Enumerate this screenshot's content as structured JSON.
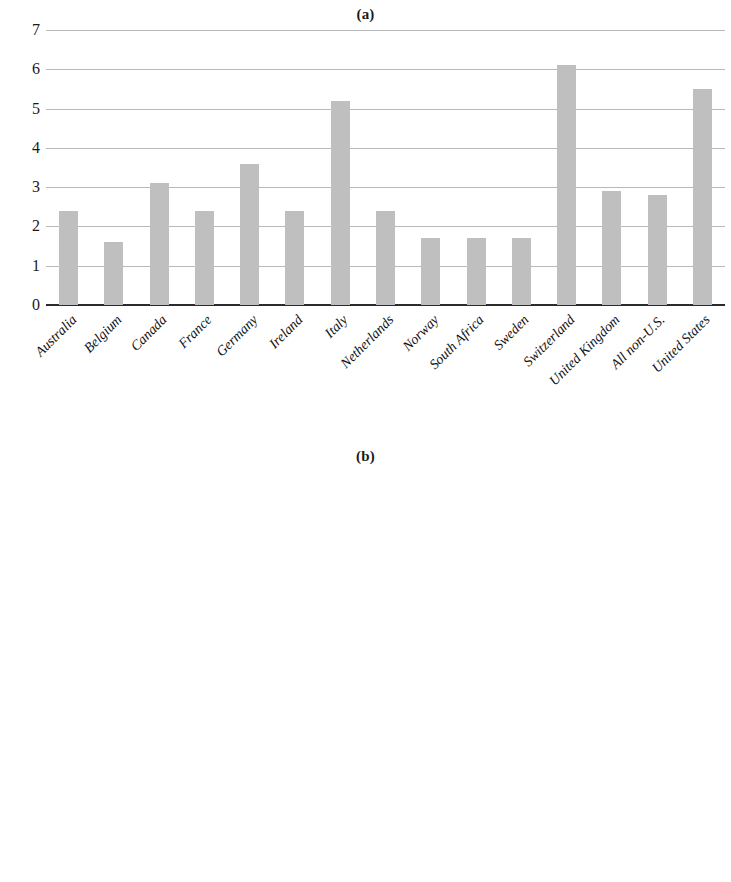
{
  "figure": {
    "panel_a_title": "(a)",
    "panel_b_title": "(b)"
  },
  "legend": {
    "items": [
      {
        "label": "Salary",
        "color": "#c9c9c9"
      },
      {
        "label": "Other",
        "color": "#a0a0a0"
      },
      {
        "label": "Bonuses",
        "color": "#595959"
      },
      {
        "label": "Stocks & Options",
        "color": "#e4e4e4"
      }
    ]
  },
  "chart_data": [
    {
      "type": "bar",
      "title": "(a)",
      "xlabel": "",
      "ylabel": "",
      "ylim": [
        0,
        7
      ],
      "yticks": [
        0,
        1,
        2,
        3,
        4,
        5,
        6,
        7
      ],
      "ytick_labels": [
        "0",
        "1",
        "2",
        "3",
        "4",
        "5",
        "6",
        "7"
      ],
      "grid": true,
      "legend": "none",
      "bar_color": "#bfbfbf",
      "categories": [
        "Australia",
        "Belgium",
        "Canada",
        "France",
        "Germany",
        "Ireland",
        "Italy",
        "Netherlands",
        "Norway",
        "South Africa",
        "Sweden",
        "Switzerland",
        "United Kingdom",
        "All non-U.S.",
        "United States"
      ],
      "values": [
        2.4,
        1.6,
        3.1,
        2.4,
        3.6,
        2.4,
        5.2,
        2.4,
        1.7,
        1.7,
        1.7,
        6.1,
        2.9,
        2.8,
        5.5
      ]
    },
    {
      "type": "bar",
      "subtype": "stacked",
      "title": "(b)",
      "xlabel": "",
      "ylabel": "",
      "ylim": [
        0,
        120
      ],
      "yticks": [
        0,
        20,
        40,
        60,
        80,
        100,
        120
      ],
      "ytick_labels": [
        "0%",
        "20%",
        "40%",
        "60%",
        "80%",
        "100%",
        "120%"
      ],
      "grid": true,
      "legend": "bottom",
      "categories": [
        "Australia",
        "Belgium",
        "Canada",
        "France",
        "Germany",
        "Ireland",
        "Italy",
        "Netherlands",
        "Norway",
        "South Africa",
        "Sweden",
        "Switzerland",
        "United Kingdom",
        "All non-U.S.",
        "United States"
      ],
      "series": [
        {
          "name": "Salary",
          "color": "#c9c9c9",
          "values": [
            46,
            58,
            33,
            61,
            39,
            44,
            55,
            44,
            55,
            42,
            62,
            50,
            41,
            45,
            28
          ]
        },
        {
          "name": "Other",
          "color": "#a0a0a0",
          "values": [
            7,
            5,
            9,
            2,
            9,
            8,
            0,
            5,
            0,
            8,
            18,
            4,
            7,
            8,
            6
          ]
        },
        {
          "name": "Bonuses",
          "color": "#595959",
          "values": [
            29,
            27,
            27,
            22,
            42,
            25,
            34,
            30,
            29,
            36,
            18,
            21,
            21,
            25,
            26
          ]
        },
        {
          "name": "Stocks & Options",
          "color": "#e4e4e4",
          "values": [
            18,
            10,
            31,
            15,
            10,
            23,
            11,
            21,
            16,
            14,
            2,
            25,
            31,
            22,
            40
          ]
        }
      ]
    }
  ]
}
